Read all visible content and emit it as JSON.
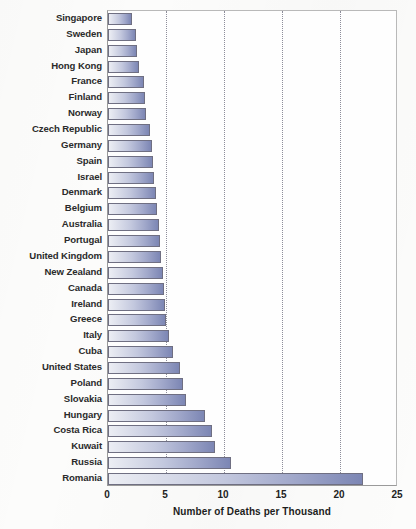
{
  "chart_data": {
    "type": "bar",
    "orientation": "horizontal",
    "title": "",
    "xlabel": "Number of Deaths per Thousand",
    "ylabel": "",
    "xlim": [
      0,
      25
    ],
    "xticks": [
      0,
      5,
      10,
      15,
      20,
      25
    ],
    "grid": "vertical-dotted",
    "legend": "none",
    "categories": [
      "Singapore",
      "Sweden",
      "Japan",
      "Hong Kong",
      "France",
      "Finland",
      "Norway",
      "Czech Republic",
      "Germany",
      "Spain",
      "Israel",
      "Denmark",
      "Belgium",
      "Australia",
      "Portugal",
      "United Kingdom",
      "New Zealand",
      "Canada",
      "Ireland",
      "Greece",
      "Italy",
      "Cuba",
      "United States",
      "Poland",
      "Slovakia",
      "Hungary",
      "Costa Rica",
      "Kuwait",
      "Russia",
      "Romania"
    ],
    "values": [
      2.1,
      2.4,
      2.5,
      2.7,
      3.1,
      3.2,
      3.3,
      3.6,
      3.8,
      3.9,
      4.0,
      4.1,
      4.2,
      4.4,
      4.5,
      4.6,
      4.7,
      4.8,
      4.9,
      5.0,
      5.3,
      5.6,
      6.2,
      6.5,
      6.7,
      8.4,
      9.0,
      9.2,
      10.6,
      22.0
    ],
    "colors": {
      "bar_gradient_start": "#eceef4",
      "bar_gradient_end": "#7c86b4",
      "bar_border": "#6f6f82",
      "gridline": "#8d8d9a",
      "axis": "#9a9a9a",
      "text": "#2b2b2b",
      "background": "#fcfcfb"
    }
  }
}
